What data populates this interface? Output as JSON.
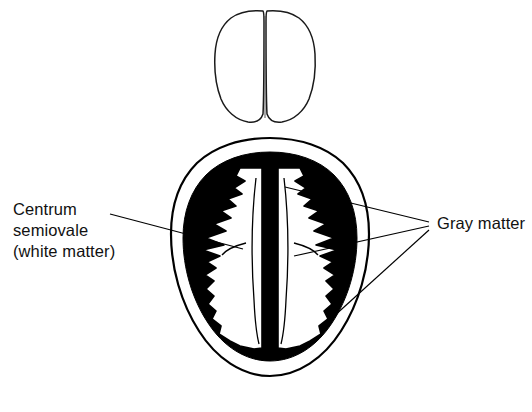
{
  "figure": {
    "background_color": "#ffffff",
    "ink_color": "#000000",
    "width": 532,
    "height": 412
  },
  "labels": {
    "centrum": {
      "name": "centrum-semiovale-label",
      "line1": "Centrum",
      "line2": "semiovale",
      "line3": "(white matter)",
      "full_text": "Centrum semiovale (white matter)",
      "position": {
        "x": 13,
        "y": 199
      }
    },
    "gray_matter": {
      "name": "gray-matter-label",
      "line1": "Gray matter",
      "full_text": "Gray matter",
      "position": {
        "x": 437,
        "y": 213
      }
    }
  },
  "leader_lines": [
    {
      "id": "leader-centrum",
      "from_label": "Centrum semiovale (white matter)",
      "start": {
        "x": 110,
        "y": 214
      },
      "end": {
        "x": 243,
        "y": 249
      },
      "points_to": "left centrum semiovale (white matter)"
    },
    {
      "id": "leader-gray-upper",
      "from_label": "Gray matter",
      "start": {
        "x": 429,
        "y": 222
      },
      "end": {
        "x": 285,
        "y": 187
      },
      "points_to": "upper right cortical gray matter"
    },
    {
      "id": "leader-gray-middle",
      "from_label": "Gray matter",
      "start": {
        "x": 429,
        "y": 226
      },
      "end": {
        "x": 294,
        "y": 256
      },
      "points_to": "medial gray matter near midline"
    },
    {
      "id": "leader-gray-lower",
      "from_label": "Gray matter",
      "start": {
        "x": 429,
        "y": 230
      },
      "end": {
        "x": 322,
        "y": 327
      },
      "points_to": "lower right cortical gray matter"
    }
  ],
  "anatomy": {
    "superior_view": {
      "name": "superior-brain-outline",
      "description": "small superior view brain outline with two hemispheres",
      "bounds": {
        "x": 216,
        "y": 9,
        "width": 98,
        "height": 115
      }
    },
    "axial_section": {
      "name": "axial-brain-section",
      "description": "large axial cross section of brain",
      "bounds": {
        "x": 170,
        "y": 137,
        "width": 200,
        "height": 243
      },
      "structures": [
        {
          "name": "outer-skull-outline",
          "fill": "none",
          "stroke": "#000000"
        },
        {
          "name": "gray-matter-cortex",
          "fill": "#000000",
          "description": "thick black ring of cortical gray matter"
        },
        {
          "name": "centrum-semiovale-left",
          "fill": "#ffffff",
          "description": "left white matter core"
        },
        {
          "name": "centrum-semiovale-right",
          "fill": "#ffffff",
          "description": "right white matter core"
        },
        {
          "name": "interhemispheric-fissure",
          "fill": "#000000",
          "description": "midline longitudinal fissure"
        }
      ]
    }
  }
}
